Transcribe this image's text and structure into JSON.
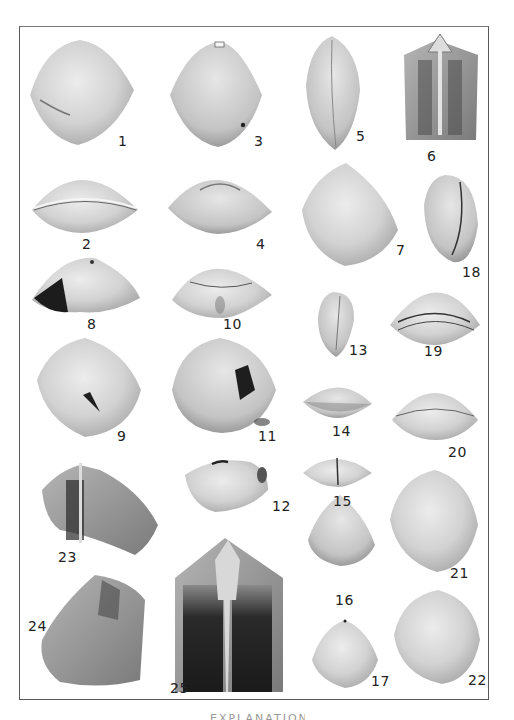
{
  "plate": {
    "caption": "EXPLANATION",
    "specimens": [
      {
        "n": "1"
      },
      {
        "n": "2"
      },
      {
        "n": "3"
      },
      {
        "n": "4"
      },
      {
        "n": "5"
      },
      {
        "n": "6"
      },
      {
        "n": "7"
      },
      {
        "n": "8"
      },
      {
        "n": "9"
      },
      {
        "n": "10"
      },
      {
        "n": "11"
      },
      {
        "n": "12"
      },
      {
        "n": "13"
      },
      {
        "n": "14"
      },
      {
        "n": "15"
      },
      {
        "n": "16"
      },
      {
        "n": "17"
      },
      {
        "n": "18"
      },
      {
        "n": "19"
      },
      {
        "n": "20"
      },
      {
        "n": "21"
      },
      {
        "n": "22"
      },
      {
        "n": "23"
      },
      {
        "n": "24"
      },
      {
        "n": "25"
      }
    ]
  },
  "colors": {
    "border": "#5a5a5a",
    "shell_light": "#e4e4e4",
    "shell_mid": "#bdbdbd",
    "shell_dark": "#1e1e1e"
  }
}
